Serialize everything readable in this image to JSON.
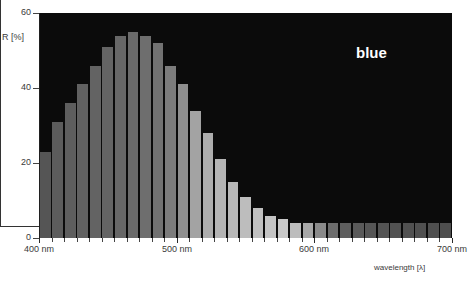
{
  "chart_data": {
    "type": "bar",
    "title": "",
    "subtitle": "",
    "xlabel": "wavelength [λ]",
    "ylabel": "R [%]",
    "ylim": [
      0,
      60
    ],
    "xlim": [
      400,
      700
    ],
    "grid": false,
    "legend": "none",
    "annotations": [
      {
        "text": "blue",
        "x": 640,
        "y": 52
      }
    ],
    "ytick_labels": [
      "0",
      "20",
      "40",
      "60"
    ],
    "ytick_values": [
      0,
      20,
      40,
      60
    ],
    "xtick_labels": [
      "400 nm",
      "500 nm",
      "600 nm",
      "700 nm"
    ],
    "xtick_values": [
      400,
      500,
      600,
      700
    ],
    "series_name": "blue",
    "bin_width_nm": 9,
    "categories": [
      404,
      413,
      422,
      431,
      440,
      449,
      458,
      467,
      476,
      485,
      494,
      503,
      512,
      521,
      530,
      539,
      548,
      557,
      566,
      575,
      584,
      593,
      602,
      611,
      620,
      629,
      638,
      647,
      656,
      665,
      674,
      683,
      692
    ],
    "values": [
      23,
      31,
      36,
      41,
      46,
      51,
      54,
      55,
      54,
      52,
      46,
      41,
      34,
      28,
      21,
      15,
      11,
      8,
      6,
      5,
      4,
      4,
      4,
      4,
      4,
      4,
      4,
      4,
      4,
      4,
      4,
      4,
      4
    ],
    "bar_colors": [
      "#555555",
      "#5c5c5c",
      "#5e5e5e",
      "#616161",
      "#636363",
      "#646464",
      "#676767",
      "#6a6a6a",
      "#6e6e6e",
      "#727272",
      "#7c7c7c",
      "#8f8f8f",
      "#a3a3a3",
      "#adadad",
      "#b4b4b4",
      "#b8b8b8",
      "#bdbdbd",
      "#c0c0c0",
      "#c4c4c4",
      "#c8c8c8",
      "#bdbdbd",
      "#a8a8a8",
      "#8a8a8a",
      "#6d6d6d",
      "#5f5f5f",
      "#5a5a5a",
      "#565656",
      "#545454",
      "#525252",
      "#515151",
      "#505050",
      "#4f4f4f",
      "#4e4e4e"
    ],
    "plot_background": "#0b0b0b",
    "page_background": "#ffffff",
    "axis_text_color": "#3a3a3a",
    "annotation_color": "#ffffff"
  }
}
